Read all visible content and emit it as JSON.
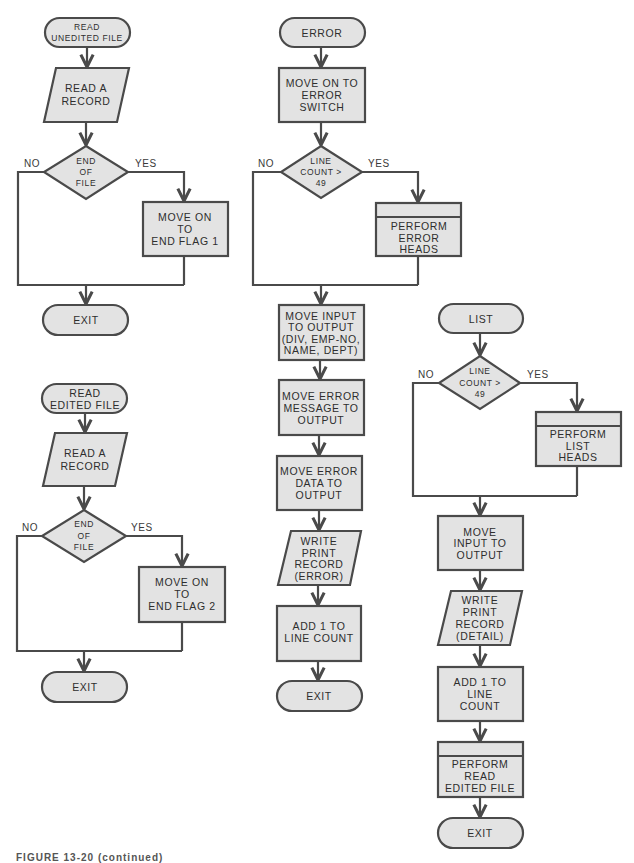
{
  "figure": {
    "caption": "FIGURE 13-20 (continued)"
  },
  "flowcharts": {
    "read_unedited": {
      "start": [
        "READ",
        "UNEDITED FILE"
      ],
      "read": [
        "READ A",
        "RECORD"
      ],
      "decision": [
        "END",
        "OF",
        "FILE"
      ],
      "no": "NO",
      "yes": "YES",
      "process": [
        "MOVE ON",
        "TO",
        "END FLAG 1"
      ],
      "exit": "EXIT"
    },
    "read_edited": {
      "start": [
        "READ",
        "EDITED FILE"
      ],
      "read": [
        "READ A",
        "RECORD"
      ],
      "decision": [
        "END",
        "OF",
        "FILE"
      ],
      "no": "NO",
      "yes": "YES",
      "process": [
        "MOVE ON",
        "TO",
        "END FLAG 2"
      ],
      "exit": "EXIT"
    },
    "error": {
      "start": "ERROR",
      "switch": [
        "MOVE ON TO",
        "ERROR",
        "SWITCH"
      ],
      "decision": [
        "LINE",
        "COUNT >",
        "49"
      ],
      "no": "NO",
      "yes": "YES",
      "perform": [
        "PERFORM",
        "ERROR",
        "HEADS"
      ],
      "move_input": [
        "MOVE INPUT",
        "TO OUTPUT",
        "(DIV, EMP-NO,",
        "NAME, DEPT)"
      ],
      "move_message": [
        "MOVE ERROR",
        "MESSAGE TO",
        "OUTPUT"
      ],
      "move_data": [
        "MOVE ERROR",
        "DATA TO",
        "OUTPUT"
      ],
      "write": [
        "WRITE",
        "PRINT",
        "RECORD",
        "(ERROR)"
      ],
      "add": [
        "ADD 1 TO",
        "LINE COUNT"
      ],
      "exit": "EXIT"
    },
    "list": {
      "start": "LIST",
      "decision": [
        "LINE",
        "COUNT >",
        "49"
      ],
      "no": "NO",
      "yes": "YES",
      "perform": [
        "PERFORM",
        "LIST",
        "HEADS"
      ],
      "move_input": [
        "MOVE",
        "INPUT TO",
        "OUTPUT"
      ],
      "write": [
        "WRITE",
        "PRINT",
        "RECORD",
        "(DETAIL)"
      ],
      "add": [
        "ADD 1 TO",
        "LINE",
        "COUNT"
      ],
      "perform_read": [
        "PERFORM",
        "READ",
        "EDITED FILE"
      ],
      "exit": "EXIT"
    }
  },
  "colors": {
    "shape_fill": "#e3e3e3",
    "stroke": "#4a4a4a",
    "text": "#2e2e2e"
  }
}
